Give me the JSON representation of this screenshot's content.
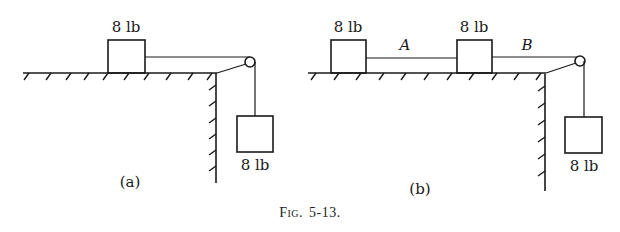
{
  "figure": {
    "caption": "Fig. 5-13.",
    "caption_prefix": "Fig.",
    "caption_number": "5-13."
  },
  "panels": [
    {
      "id": "a",
      "label": "(a)",
      "table_blocks": [
        {
          "weight": "8 lb"
        }
      ],
      "rope_labels": [],
      "hanging_block": {
        "weight": "8 lb"
      }
    },
    {
      "id": "b",
      "label": "(b)",
      "table_blocks": [
        {
          "weight": "8 lb"
        },
        {
          "weight": "8 lb"
        }
      ],
      "rope_labels": [
        "A",
        "B"
      ],
      "hanging_block": {
        "weight": "8 lb"
      }
    }
  ]
}
